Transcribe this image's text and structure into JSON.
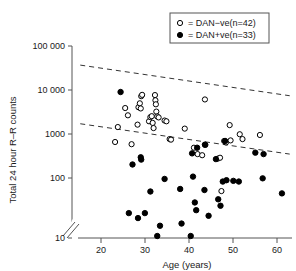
{
  "chart_data": {
    "type": "scatter",
    "title": "",
    "xlabel": "Age (years)",
    "ylabel": "Total 24 hour R–R counts",
    "xlim": [
      17,
      65
    ],
    "ylim_log": [
      10,
      100000
    ],
    "yscale": "log",
    "y_axis_break": true,
    "grid": false,
    "xticks": [
      20,
      30,
      40,
      50,
      60
    ],
    "xtick_labels": [
      "20",
      "30",
      "40",
      "50",
      "60"
    ],
    "yticks": [
      10,
      100,
      1000,
      10000,
      100000
    ],
    "ytick_labels": [
      "10",
      "100",
      "1000",
      "10 000",
      "100 000"
    ],
    "legend_position": "top-right",
    "series": [
      {
        "name": "DAN−ve(n=42)",
        "marker": "open-circle",
        "color": "#000000",
        "n": 42,
        "points": [
          [
            26.4,
            1000
          ],
          [
            27.0,
            2050
          ],
          [
            28.6,
            5100
          ],
          [
            29.2,
            3600
          ],
          [
            30.0,
            900
          ],
          [
            31.3,
            2300
          ],
          [
            31.5,
            5300
          ],
          [
            31.8,
            6400
          ],
          [
            32.0,
            5000
          ],
          [
            32.1,
            9000
          ],
          [
            32.3,
            9600
          ],
          [
            33.8,
            2700
          ],
          [
            34.1,
            3300
          ],
          [
            34.4,
            3450
          ],
          [
            34.6,
            2500
          ],
          [
            34.8,
            1950
          ],
          [
            35.1,
            9500
          ],
          [
            35.2,
            7400
          ],
          [
            35.3,
            6100
          ],
          [
            35.4,
            4300
          ],
          [
            35.6,
            3400
          ],
          [
            35.9,
            3250
          ],
          [
            37.2,
            2800
          ],
          [
            37.6,
            2700
          ],
          [
            38.3,
            1150
          ],
          [
            38.6,
            1120
          ],
          [
            41.6,
            1900
          ],
          [
            43.6,
            760
          ],
          [
            44.4,
            560
          ],
          [
            45.4,
            530
          ],
          [
            46.0,
            7700
          ],
          [
            46.1,
            870
          ],
          [
            48.8,
            450
          ],
          [
            49.3,
            470
          ],
          [
            49.6,
            95
          ],
          [
            50.2,
            1050
          ],
          [
            50.6,
            980
          ],
          [
            51.4,
            2250
          ],
          [
            51.6,
            1080
          ],
          [
            53.6,
            1450
          ],
          [
            54.2,
            1150
          ],
          [
            58.0,
            1400
          ]
        ]
      },
      {
        "name": "DAN+ve(n=33)",
        "marker": "filled-circle",
        "color": "#000000",
        "n": 33,
        "points": [
          [
            27.6,
            11000
          ],
          [
            29.4,
            33
          ],
          [
            30.2,
            340
          ],
          [
            31.4,
            26
          ],
          [
            32.0,
            480
          ],
          [
            32.1,
            430
          ],
          [
            32.9,
            33
          ],
          [
            34.1,
            93
          ],
          [
            35.6,
            11
          ],
          [
            36.2,
            18
          ],
          [
            37.2,
            170
          ],
          [
            40.6,
            105
          ],
          [
            40.9,
            20
          ],
          [
            42.9,
            11
          ],
          [
            43.2,
            580
          ],
          [
            43.4,
            190
          ],
          [
            43.8,
            55
          ],
          [
            44.1,
            38
          ],
          [
            44.3,
            760
          ],
          [
            45.9,
            100
          ],
          [
            46.0,
            880
          ],
          [
            46.8,
            29
          ],
          [
            48.4,
            440
          ],
          [
            48.9,
            64
          ],
          [
            49.4,
            47
          ],
          [
            49.9,
            150
          ],
          [
            50.4,
            1050
          ],
          [
            50.7,
            160
          ],
          [
            52.2,
            155
          ],
          [
            53.4,
            150
          ],
          [
            57.0,
            600
          ],
          [
            58.6,
            175
          ],
          [
            58.8,
            560
          ],
          [
            62.8,
            85
          ]
        ]
      }
    ],
    "trend_lines": [
      {
        "name": "upper-reference-line",
        "style": "dashed",
        "x_start": 18.8,
        "y_start": 40000,
        "x_end": 64.5,
        "y_end": 9200
      },
      {
        "name": "lower-reference-line",
        "style": "dashed",
        "x_start": 18.8,
        "y_start": 2400,
        "x_end": 64.5,
        "y_end": 560
      }
    ]
  },
  "legend": {
    "entries": [
      {
        "marker": "open-circle",
        "equals": "=",
        "label_pre": "DAN−ve(",
        "label_ital": "n",
        "label_post": "=42)"
      },
      {
        "marker": "filled-circle",
        "equals": "=",
        "label_pre": "DAN+ve(",
        "label_ital": "n",
        "label_post": "=33)"
      }
    ],
    "entry_0_text": "= DAN−ve(n=42)",
    "entry_1_text": "= DAN+ve(n=33)"
  },
  "axes": {
    "x_title": "Age (years)",
    "y_title": "Total 24 hour R–R counts",
    "x_tick_0": "20",
    "x_tick_1": "30",
    "x_tick_2": "40",
    "x_tick_3": "50",
    "x_tick_4": "60",
    "y_tick_0": "100 000",
    "y_tick_1": "10 000",
    "y_tick_2": "1000",
    "y_tick_3": "100",
    "y_tick_4": "10"
  },
  "colors": {
    "axis": "#555555",
    "ink": "#1a1a1a",
    "marker": "#000000",
    "background": "#ffffff"
  }
}
